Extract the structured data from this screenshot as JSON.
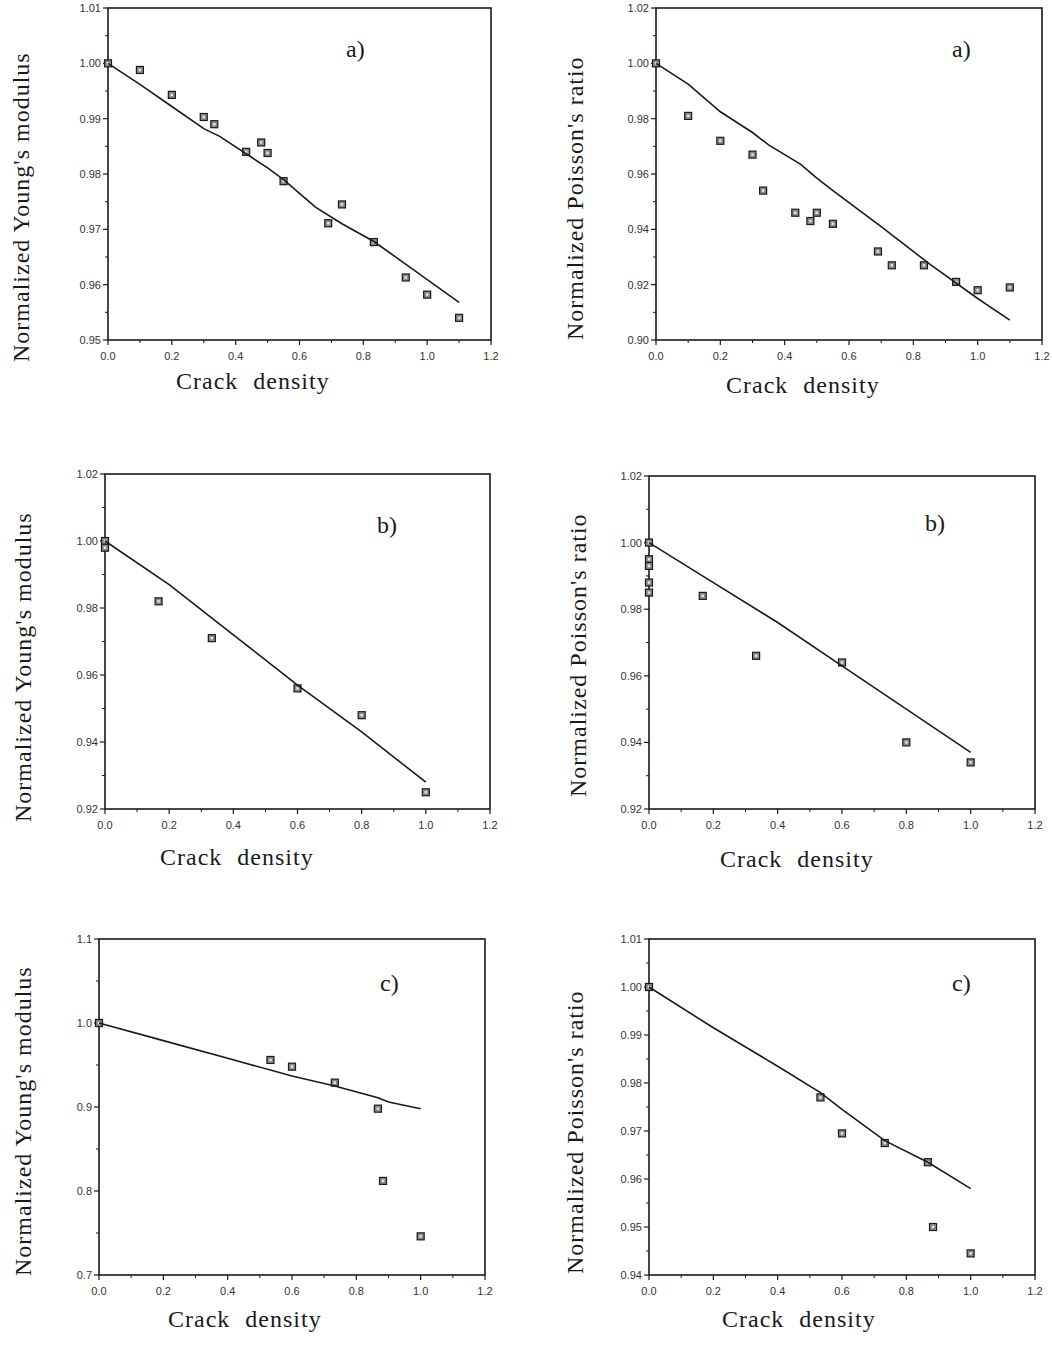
{
  "chart_data": [
    {
      "id": "young_a",
      "type": "scatter",
      "panel_label": "a)",
      "title": "",
      "xlabel": "Crack density",
      "ylabel": "Normalized Young's modulus",
      "xlim": [
        0.0,
        1.2
      ],
      "ylim": [
        0.95,
        1.01
      ],
      "xticks": [
        "0.0",
        "0.2",
        "0.4",
        "0.6",
        "0.8",
        "1.0",
        "1.2"
      ],
      "yticks": [
        "0.95",
        "0.96",
        "0.97",
        "0.98",
        "0.99",
        "1.00",
        "1.01"
      ],
      "grid": false,
      "series": [
        {
          "name": "measured",
          "kind": "markers",
          "x": [
            0.0,
            0.1,
            0.2,
            0.3,
            0.333,
            0.433,
            0.48,
            0.5,
            0.55,
            0.69,
            0.733,
            0.833,
            0.933,
            1.0,
            1.1
          ],
          "y": [
            1.0,
            0.9988,
            0.9943,
            0.9903,
            0.989,
            0.984,
            0.9857,
            0.9838,
            0.9787,
            0.9711,
            0.9745,
            0.9677,
            0.9613,
            0.9582,
            0.954
          ]
        },
        {
          "name": "model",
          "kind": "line",
          "x": [
            0.0,
            0.1,
            0.2,
            0.3,
            0.35,
            0.5,
            0.55,
            0.65,
            0.733,
            0.833,
            0.95,
            1.1
          ],
          "y": [
            1.0,
            0.9962,
            0.9922,
            0.9882,
            0.9868,
            0.9811,
            0.979,
            0.974,
            0.971,
            0.9678,
            0.963,
            0.9568
          ]
        }
      ]
    },
    {
      "id": "poisson_a",
      "type": "scatter",
      "panel_label": "a)",
      "title": "",
      "xlabel": "Crack density",
      "ylabel": "Normalized Poisson's ratio",
      "xlim": [
        0.0,
        1.2
      ],
      "ylim": [
        0.9,
        1.02
      ],
      "xticks": [
        "0.0",
        "0.2",
        "0.4",
        "0.6",
        "0.8",
        "1.0",
        "1.2"
      ],
      "yticks": [
        "0.90",
        "0.92",
        "0.94",
        "0.96",
        "0.98",
        "1.00",
        "1.02"
      ],
      "grid": false,
      "series": [
        {
          "name": "measured",
          "kind": "markers",
          "x": [
            0.0,
            0.1,
            0.2,
            0.3,
            0.333,
            0.433,
            0.48,
            0.5,
            0.55,
            0.69,
            0.733,
            0.833,
            0.933,
            1.0,
            1.1
          ],
          "y": [
            1.0,
            0.981,
            0.972,
            0.967,
            0.954,
            0.946,
            0.943,
            0.946,
            0.942,
            0.932,
            0.927,
            0.927,
            0.921,
            0.918,
            0.919
          ]
        },
        {
          "name": "model",
          "kind": "line",
          "x": [
            0.0,
            0.1,
            0.2,
            0.3,
            0.35,
            0.45,
            0.5,
            0.55,
            0.7,
            0.85,
            1.0,
            1.1
          ],
          "y": [
            1.0,
            0.9925,
            0.9825,
            0.975,
            0.9705,
            0.9635,
            0.9585,
            0.954,
            0.941,
            0.9275,
            0.915,
            0.9072
          ]
        }
      ]
    },
    {
      "id": "young_b",
      "type": "scatter",
      "panel_label": "b)",
      "title": "",
      "xlabel": "Crack density",
      "ylabel": "Normalized Young's modulus",
      "xlim": [
        0.0,
        1.2
      ],
      "ylim": [
        0.92,
        1.02
      ],
      "xticks": [
        "0.0",
        "0.2",
        "0.4",
        "0.6",
        "0.8",
        "1.0",
        "1.2"
      ],
      "yticks": [
        "0.92",
        "0.94",
        "0.96",
        "0.98",
        "1.00",
        "1.02"
      ],
      "grid": false,
      "series": [
        {
          "name": "measured",
          "kind": "markers",
          "x": [
            0.0,
            0.0,
            0.167,
            0.333,
            0.6,
            0.8,
            1.0
          ],
          "y": [
            1.0,
            0.998,
            0.982,
            0.971,
            0.956,
            0.948,
            0.925
          ]
        },
        {
          "name": "model",
          "kind": "line",
          "x": [
            0.0,
            0.2,
            0.4,
            0.6,
            0.8,
            1.0
          ],
          "y": [
            1.0,
            0.987,
            0.972,
            0.957,
            0.943,
            0.928
          ]
        }
      ]
    },
    {
      "id": "poisson_b",
      "type": "scatter",
      "panel_label": "b)",
      "title": "",
      "xlabel": "Crack density",
      "ylabel": "Normalized Poisson's ratio",
      "xlim": [
        0.0,
        1.2
      ],
      "ylim": [
        0.92,
        1.02
      ],
      "xticks": [
        "0.0",
        "0.2",
        "0.4",
        "0.6",
        "0.8",
        "1.0",
        "1.2"
      ],
      "yticks": [
        "0.92",
        "0.94",
        "0.96",
        "0.98",
        "1.00",
        "1.02"
      ],
      "grid": false,
      "series": [
        {
          "name": "measured",
          "kind": "markers",
          "x": [
            0.0,
            0.0,
            0.0,
            0.0,
            0.0,
            0.167,
            0.333,
            0.6,
            0.8,
            1.0
          ],
          "y": [
            1.0,
            0.995,
            0.993,
            0.988,
            0.985,
            0.984,
            0.966,
            0.964,
            0.94,
            0.934
          ]
        },
        {
          "name": "model",
          "kind": "line",
          "x": [
            0.0,
            0.2,
            0.4,
            0.6,
            0.8,
            1.0
          ],
          "y": [
            1.0,
            0.988,
            0.976,
            0.963,
            0.95,
            0.937
          ]
        }
      ]
    },
    {
      "id": "young_c",
      "type": "scatter",
      "panel_label": "c)",
      "title": "",
      "xlabel": "Crack density",
      "ylabel": "Normalized Young's modulus",
      "xlim": [
        0.0,
        1.2
      ],
      "ylim": [
        0.7,
        1.1
      ],
      "xticks": [
        "0.0",
        "0.2",
        "0.4",
        "0.6",
        "0.8",
        "1.0",
        "1.2"
      ],
      "yticks": [
        "0.7",
        "0.8",
        "0.9",
        "1.0",
        "1.1"
      ],
      "grid": false,
      "series": [
        {
          "name": "measured",
          "kind": "markers",
          "x": [
            0.0,
            0.533,
            0.6,
            0.733,
            0.867,
            0.883,
            1.0
          ],
          "y": [
            1.0,
            0.956,
            0.948,
            0.929,
            0.898,
            0.812,
            0.746
          ]
        },
        {
          "name": "model",
          "kind": "line",
          "x": [
            0.0,
            0.2,
            0.4,
            0.6,
            0.733,
            0.867,
            0.9,
            1.0
          ],
          "y": [
            1.0,
            0.979,
            0.958,
            0.937,
            0.925,
            0.911,
            0.906,
            0.898
          ]
        }
      ]
    },
    {
      "id": "poisson_c",
      "type": "scatter",
      "panel_label": "c)",
      "title": "",
      "xlabel": "Crack density",
      "ylabel": "Normalized Poisson's ratio",
      "xlim": [
        0.0,
        1.2
      ],
      "ylim": [
        0.94,
        1.01
      ],
      "xticks": [
        "0.0",
        "0.2",
        "0.4",
        "0.6",
        "0.8",
        "1.0",
        "1.2"
      ],
      "yticks": [
        "0.94",
        "0.95",
        "0.96",
        "0.97",
        "0.98",
        "0.99",
        "1.00",
        "1.01"
      ],
      "grid": false,
      "series": [
        {
          "name": "measured",
          "kind": "markers",
          "x": [
            0.0,
            0.533,
            0.6,
            0.733,
            0.867,
            0.883,
            1.0
          ],
          "y": [
            1.0,
            0.977,
            0.9695,
            0.9675,
            0.9635,
            0.95,
            0.9445
          ]
        },
        {
          "name": "model",
          "kind": "line",
          "x": [
            0.0,
            0.2,
            0.4,
            0.533,
            0.6,
            0.733,
            0.867,
            1.0
          ],
          "y": [
            1.0,
            0.9915,
            0.9835,
            0.978,
            0.9745,
            0.968,
            0.9635,
            0.958
          ]
        }
      ]
    }
  ],
  "panels": [
    {
      "id": "young_a",
      "xlabel": "Crack density",
      "ylabel": "Normalized Young's modulus",
      "tag": "a)"
    },
    {
      "id": "poisson_a",
      "xlabel": "Crack density",
      "ylabel": "Normalized Poisson's ratio",
      "tag": "a)"
    },
    {
      "id": "young_b",
      "xlabel": "Crack density",
      "ylabel": "Normalized Young's modulus",
      "tag": "b)"
    },
    {
      "id": "poisson_b",
      "xlabel": "Crack density",
      "ylabel": "Normalized Poisson's ratio",
      "tag": "b)"
    },
    {
      "id": "young_c",
      "xlabel": "Crack density",
      "ylabel": "Normalized Young's modulus",
      "tag": "c)"
    },
    {
      "id": "poisson_c",
      "xlabel": "Crack density",
      "ylabel": "Normalized Poisson's ratio",
      "tag": "c)"
    }
  ],
  "colors": {
    "ink": "#1a1a1a",
    "marker_fill": "#8a8a8a",
    "background": "#ffffff"
  }
}
